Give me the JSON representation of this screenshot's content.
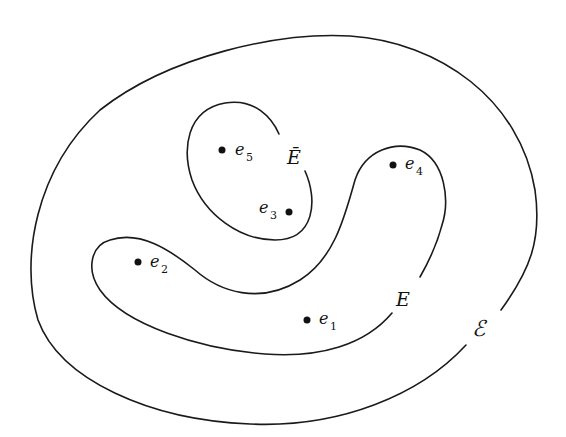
{
  "diagram": {
    "background": "#ffffff",
    "stroke_color": "#1a1a1a",
    "sets": [
      {
        "id": "outer",
        "label": "ℰ",
        "x": 472,
        "y": 336
      },
      {
        "id": "E",
        "label": "E",
        "x": 396,
        "y": 306
      },
      {
        "id": "E-bar",
        "label": "Ē",
        "x": 287,
        "y": 164
      }
    ],
    "points": [
      {
        "id": "e1",
        "base": "e",
        "sub": "1",
        "cx": 307,
        "cy": 320
      },
      {
        "id": "e2",
        "base": "e",
        "sub": "2",
        "cx": 138,
        "cy": 262
      },
      {
        "id": "e3",
        "base": "e",
        "sub": "3",
        "cx": 289,
        "cy": 212
      },
      {
        "id": "e4",
        "base": "e",
        "sub": "4",
        "cx": 393,
        "cy": 165
      },
      {
        "id": "e5",
        "base": "e",
        "sub": "5",
        "cx": 222,
        "cy": 150
      }
    ]
  }
}
